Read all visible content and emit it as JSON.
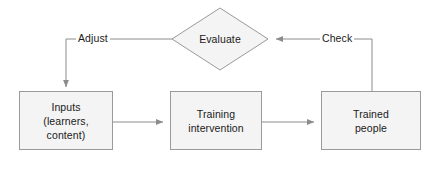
{
  "diagram": {
    "colors": {
      "node_fill": "#f4f4f4",
      "node_stroke": "#9a9a9a",
      "connector": "#8c8c8c",
      "text": "#1a1a1a",
      "background": "#ffffff"
    },
    "nodes": [
      {
        "id": "evaluate",
        "shape": "diamond",
        "label": "Evaluate"
      },
      {
        "id": "inputs",
        "shape": "rectangle",
        "label": "Inputs\n(learners,\ncontent)"
      },
      {
        "id": "training",
        "shape": "rectangle",
        "label": "Training\nintervention"
      },
      {
        "id": "trained",
        "shape": "rectangle",
        "label": "Trained\npeople"
      }
    ],
    "edges": [
      {
        "id": "adjust",
        "from": "evaluate",
        "to": "inputs",
        "label": "Adjust",
        "arrow": "down"
      },
      {
        "id": "inputs-to-training",
        "from": "inputs",
        "to": "training",
        "label": "",
        "arrow": "right"
      },
      {
        "id": "training-to-trained",
        "from": "training",
        "to": "trained",
        "label": "",
        "arrow": "right"
      },
      {
        "id": "check",
        "from": "trained",
        "to": "evaluate",
        "label": "Check",
        "arrow": "left"
      }
    ]
  }
}
